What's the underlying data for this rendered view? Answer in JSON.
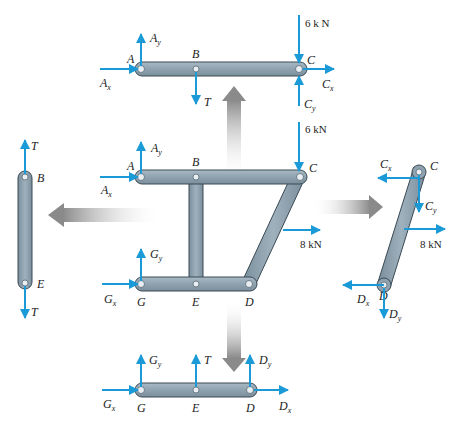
{
  "diagram": {
    "colors": {
      "force": "#1a9ad6",
      "member": "#8fa3b0",
      "member_edge": "#3a4a55",
      "transfer_arrow": "#9a9a9a",
      "text": "#222222"
    },
    "assembled_frame": {
      "joints": [
        "A",
        "B",
        "C",
        "G",
        "E",
        "D"
      ],
      "labels": {
        "A": "A",
        "B": "B",
        "C": "C",
        "G": "G",
        "E": "E",
        "D": "D"
      },
      "forces": {
        "Ax": "A",
        "Ax_sub": "x",
        "Ay": "A",
        "Ay_sub": "y",
        "Gx": "G",
        "Gx_sub": "x",
        "Gy": "G",
        "Gy_sub": "y",
        "load_C": "6 kN",
        "load_CD": "8 kN"
      }
    },
    "member_ABC": {
      "labels": {
        "A": "A",
        "B": "B",
        "C": "C"
      },
      "forces": {
        "Ax": "A",
        "Ax_sub": "x",
        "Ay": "A",
        "Ay_sub": "y",
        "T": "T",
        "Cx": "C",
        "Cx_sub": "x",
        "Cy": "C",
        "Cy_sub": "y",
        "load_C": "6 k  N"
      }
    },
    "member_BE": {
      "labels": {
        "B": "B",
        "E": "E"
      },
      "forces": {
        "T_top": "T",
        "T_bottom": "T"
      }
    },
    "member_CD": {
      "labels": {
        "C": "C",
        "D": "D"
      },
      "forces": {
        "Cx": "C",
        "Cx_sub": "x",
        "Cy": "C",
        "Cy_sub": "y",
        "Dx": "D",
        "Dx_sub": "x",
        "Dy": "D",
        "Dy_sub": "y",
        "load": "8 kN"
      }
    },
    "member_GED": {
      "labels": {
        "G": "G",
        "E": "E",
        "D": "D"
      },
      "forces": {
        "Gx": "G",
        "Gx_sub": "x",
        "Gy": "G",
        "Gy_sub": "y",
        "T": "T",
        "Dx": "D",
        "Dx_sub": "x",
        "Dy": "D",
        "Dy_sub": "y"
      }
    },
    "transfer_arrows": [
      "up-to-ABC",
      "left-to-BE",
      "right-to-CD",
      "down-to-GED"
    ]
  }
}
